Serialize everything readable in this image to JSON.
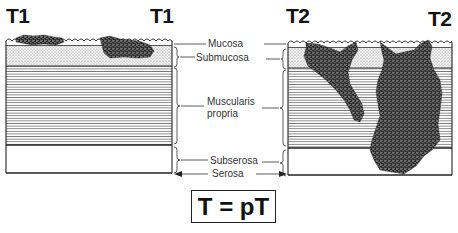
{
  "diagram": {
    "title_formula": "T = pT",
    "left_panel": {
      "label_left": "T1",
      "label_right": "T1",
      "stage": "T1",
      "description": "Tumor confined to mucosa / submucosa"
    },
    "right_panel": {
      "label_left": "T2",
      "label_right": "T2",
      "stage": "T2",
      "description": "Tumor invades muscularis propria"
    },
    "layers": [
      {
        "name": "Mucosa",
        "line1": "Mucosa"
      },
      {
        "name": "Submucosa",
        "line1": "Submucosa"
      },
      {
        "name": "Muscularis propria",
        "line1": "Muscularis",
        "line2": "propria"
      },
      {
        "name": "Subserosa",
        "line1": "Subserosa"
      },
      {
        "name": "Serosa",
        "line1": "Serosa"
      }
    ],
    "colors": {
      "outline": "#222222",
      "tumor": "#2a2a2a",
      "submucosa_fill": "#e4e4e4",
      "muscularis_lines": "#8a8a8a",
      "background": "#ffffff"
    }
  }
}
